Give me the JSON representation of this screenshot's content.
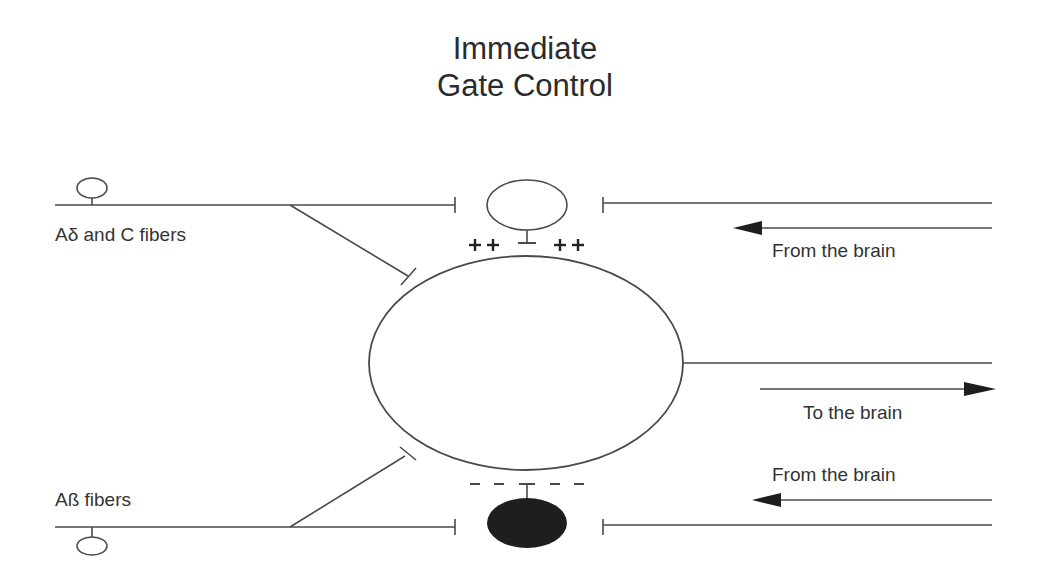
{
  "title": {
    "line1": "Immediate",
    "line2": "Gate Control"
  },
  "labels": {
    "a_delta_c": "Aδ and C fibers",
    "a_beta": "Aß fibers",
    "from_brain_top": "From the brain",
    "to_brain": "To the brain",
    "from_brain_bottom": "From the brain"
  },
  "synapse_signs": {
    "excitatory": "++ ++",
    "inhibitory": "- - - -"
  },
  "colors": {
    "line": "#555555",
    "text": "#333333",
    "filled_neuron": "#1e1e1e"
  }
}
